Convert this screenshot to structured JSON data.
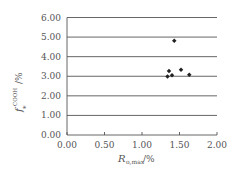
{
  "chart_data": {
    "type": "scatter",
    "title": "",
    "xlabel": "R o,max /%",
    "ylabel": "f* COOH /%",
    "xlabel_main": "R",
    "xlabel_sub": "o,max",
    "xlabel_unit": "/%",
    "ylabel_main": "f",
    "ylabel_sub": "*",
    "ylabel_sup": "COOH",
    "ylabel_unit": "/%",
    "xlim": [
      0,
      2
    ],
    "ylim": [
      0,
      6
    ],
    "xticks": [
      "0.00",
      "0.50",
      "1.00",
      "1.50",
      "2.00"
    ],
    "yticks": [
      "0.00",
      "1.00",
      "2.00",
      "3.00",
      "4.00",
      "5.00",
      "6.00"
    ],
    "grid": "horizontal",
    "legend": null,
    "points": [
      {
        "x": 1.43,
        "y": 4.81
      },
      {
        "x": 1.36,
        "y": 3.27
      },
      {
        "x": 1.34,
        "y": 2.99
      },
      {
        "x": 1.4,
        "y": 3.05
      },
      {
        "x": 1.52,
        "y": 3.33
      },
      {
        "x": 1.63,
        "y": 3.08
      }
    ],
    "colors": {
      "marker": "#222222",
      "grid": "#555555",
      "axis": "#555555",
      "text": "#555555"
    }
  }
}
